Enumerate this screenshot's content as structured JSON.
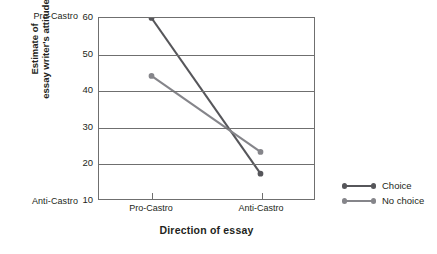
{
  "chart_data": {
    "type": "line",
    "title": "",
    "xlabel": "Direction of essay",
    "ylabel_line1": "Estimate of",
    "ylabel_line2": "essay writer's attitude",
    "categories": [
      "Pro-Castro",
      "Anti-Castro"
    ],
    "x": [
      0,
      1
    ],
    "ylim": [
      10,
      60
    ],
    "yticks": [
      60,
      50,
      40,
      30,
      20,
      10
    ],
    "grid": true,
    "grid_axis": "y",
    "legend_position": "right",
    "y_anchor_high": "Pro-Castro",
    "y_anchor_low": "Anti-Castro",
    "series": [
      {
        "name": "Choice",
        "values": [
          60,
          17
        ],
        "color": "#56565a"
      },
      {
        "name": "No choice",
        "values": [
          44,
          23
        ],
        "color": "#85858a"
      }
    ]
  },
  "axes": {
    "y_anchor_top": "Pro-Castro",
    "y_anchor_bottom": "Anti-Castro",
    "y_title_line1": "Estimate of",
    "y_title_line2": "essay writer's attitude",
    "x_title": "Direction of essay",
    "x_tick_labels": [
      "Pro-Castro",
      "Anti-Castro"
    ],
    "y_tick_labels": [
      "60",
      "50",
      "40",
      "30",
      "20",
      "10"
    ]
  },
  "legend": {
    "items": [
      {
        "label": "Choice",
        "color": "#56565a"
      },
      {
        "label": "No choice",
        "color": "#85858a"
      }
    ]
  },
  "colors": {
    "frame": "#6f6f6f",
    "text": "#231f20",
    "series_choice": "#56565a",
    "series_nochoice": "#85858a",
    "background": "#ffffff"
  }
}
